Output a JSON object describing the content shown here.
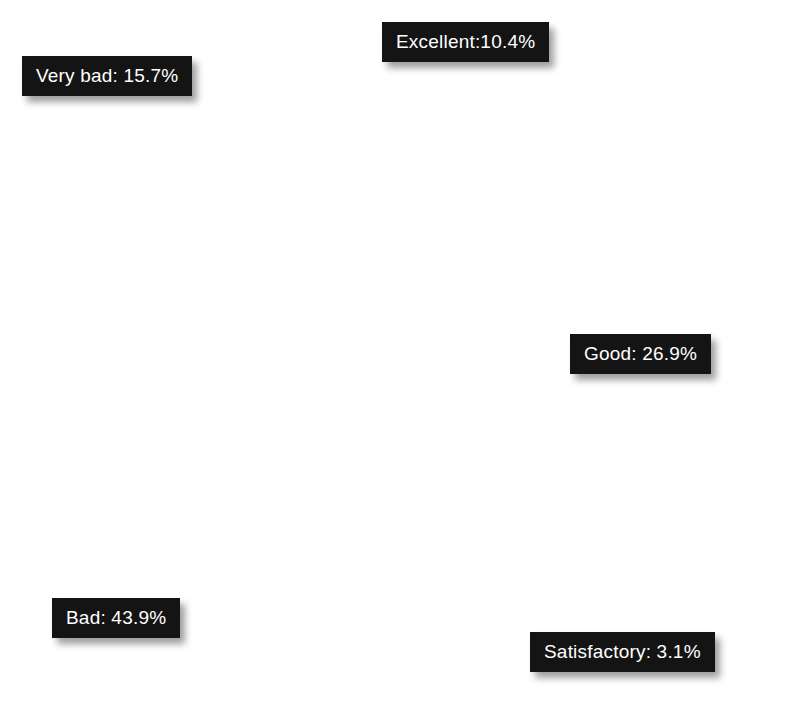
{
  "chart_data": {
    "type": "pie",
    "title": "",
    "subtitle": "",
    "xlabel": "",
    "ylabel": "",
    "legend_position": "none",
    "grid": false,
    "labels_on_slices": true,
    "background_color": "#ffffff",
    "center": {
      "x": 357,
      "y": 358
    },
    "radius": 337,
    "start_angle_deg": 0,
    "direction": "clockwise",
    "categories": [
      "Excellent",
      "Good",
      "Satisfactory",
      "Bad",
      "Very bad"
    ],
    "values": [
      10.4,
      26.9,
      3.1,
      43.9,
      15.7
    ],
    "units": "%",
    "colors": [
      "#bcbcbc",
      "#808080",
      "#9a9a9a",
      "#2a2a2a",
      "#151515"
    ],
    "slices": [
      {
        "name": "Excellent",
        "value": 10.4,
        "label": "Excellent:10.4%",
        "color": "#bcbcbc",
        "start_deg": 0.0,
        "end_deg": 37.44
      },
      {
        "name": "Good",
        "value": 26.9,
        "label": "Good: 26.9%",
        "color": "#808080",
        "start_deg": 37.44,
        "end_deg": 134.28
      },
      {
        "name": "Satisfactory",
        "value": 3.1,
        "label": "Satisfactory: 3.1%",
        "color": "#9a9a9a",
        "start_deg": 134.28,
        "end_deg": 145.44
      },
      {
        "name": "Bad",
        "value": 43.9,
        "label": "Bad: 43.9%",
        "color": "#2a2a2a",
        "start_deg": 145.44,
        "end_deg": 303.48
      },
      {
        "name": "Very bad",
        "value": 15.7,
        "label": "Very bad: 15.7%",
        "color": "#151515",
        "start_deg": 303.48,
        "end_deg": 360.0
      }
    ]
  },
  "labels": {
    "excellent": "Excellent:10.4%",
    "good": "Good: 26.9%",
    "satisfactory": "Satisfactory: 3.1%",
    "bad": "Bad: 43.9%",
    "very_bad": "Very bad: 15.7%"
  }
}
